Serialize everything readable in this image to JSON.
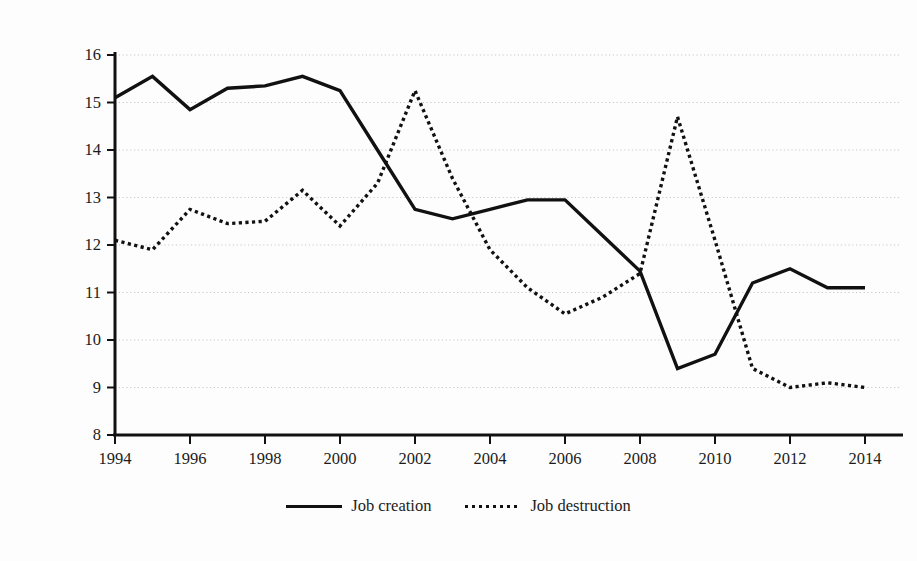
{
  "chart_data": {
    "type": "line",
    "title": "",
    "xlabel": "",
    "ylabel": "Percentage of employemnt",
    "xlim": [
      1994,
      2014
    ],
    "ylim": [
      8,
      16
    ],
    "grid": true,
    "legend_position": "bottom-center",
    "x": [
      1994,
      1995,
      1996,
      1997,
      1998,
      1999,
      2000,
      2001,
      2002,
      2003,
      2004,
      2005,
      2006,
      2007,
      2008,
      2009,
      2010,
      2011,
      2012,
      2013,
      2014
    ],
    "xtick_labels": [
      "1994",
      "1996",
      "1998",
      "2000",
      "2002",
      "2004",
      "2006",
      "2008",
      "2010",
      "2012",
      "2014"
    ],
    "xticks": [
      1994,
      1996,
      1998,
      2000,
      2002,
      2004,
      2006,
      2008,
      2010,
      2012,
      2014
    ],
    "ytick_labels": [
      "8",
      "9",
      "10",
      "11",
      "12",
      "13",
      "14",
      "15",
      "16"
    ],
    "yticks": [
      8,
      9,
      10,
      11,
      12,
      13,
      14,
      15,
      16
    ],
    "series": [
      {
        "name": "Job creation",
        "style": "solid",
        "color": "#111111",
        "values": [
          15.1,
          15.55,
          14.85,
          15.3,
          15.35,
          15.55,
          15.25,
          14.0,
          12.75,
          12.55,
          12.75,
          12.95,
          12.95,
          12.2,
          11.45,
          9.4,
          9.7,
          11.2,
          11.5,
          11.1,
          11.1
        ]
      },
      {
        "name": "Job destruction",
        "style": "dotted",
        "color": "#111111",
        "values": [
          12.1,
          11.9,
          12.75,
          12.45,
          12.5,
          13.15,
          12.4,
          13.3,
          15.25,
          13.4,
          11.9,
          11.1,
          10.55,
          10.9,
          11.4,
          14.7,
          12.1,
          9.4,
          9.0,
          9.1,
          9.0
        ]
      }
    ]
  },
  "legend": {
    "entries": [
      {
        "label": "Job creation",
        "style": "solid"
      },
      {
        "label": "Job destruction",
        "style": "dotted"
      }
    ]
  }
}
